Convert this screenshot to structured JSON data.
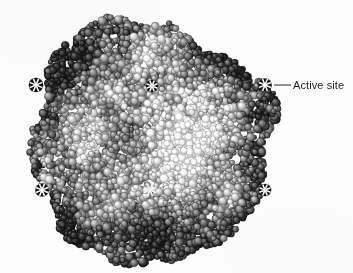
{
  "figure": {
    "kind": "molecular-structure-illustration",
    "width": 353,
    "height": 273,
    "background_color": "#fdfdfd"
  },
  "annotations": {
    "callouts": [
      {
        "id": "active-site-callout",
        "label": "Active site",
        "label_x": 293,
        "label_y": 79,
        "leader": {
          "x1": 274,
          "y1": 85,
          "x2": 291,
          "y2": 85
        },
        "leader_color": "#2a2a2a",
        "text_color": "#1c1c1c"
      }
    ],
    "markers": [
      {
        "id": "active-site-marker-top-left",
        "x": 36,
        "y": 85,
        "r": 7.5,
        "style": "dark",
        "spokes": 8
      },
      {
        "id": "active-site-marker-top-center",
        "x": 152,
        "y": 86,
        "r": 6.5,
        "style": "dark",
        "spokes": 8
      },
      {
        "id": "active-site-marker-top-right",
        "x": 265,
        "y": 85,
        "r": 7.0,
        "style": "dark",
        "spokes": 8
      },
      {
        "id": "active-site-marker-bottom-left",
        "x": 42,
        "y": 190,
        "r": 7.0,
        "style": "dark",
        "spokes": 8
      },
      {
        "id": "active-site-marker-bottom-center",
        "x": 150,
        "y": 190,
        "r": 6.5,
        "style": "light",
        "spokes": 8
      },
      {
        "id": "active-site-marker-bottom-right",
        "x": 265,
        "y": 190,
        "r": 6.5,
        "style": "dark",
        "spokes": 8
      }
    ],
    "marker_colors": {
      "dark": "#141414",
      "light": "#f2f2f2"
    }
  },
  "molecule": {
    "center_x": 150,
    "center_y": 140,
    "radius_x": 124,
    "radius_y": 120,
    "top_edge_y": 22,
    "bottom_edge_y": 258,
    "left_edge_x": 26,
    "right_edge_x": 274,
    "atom_count": 4200,
    "atom_radius_min": 2.4,
    "atom_radius_max": 4.4,
    "palette": {
      "shadow": "#0d0d0d",
      "dark": "#2e2e2e",
      "mid": "#6a6a6a",
      "light": "#b4b4b4",
      "highlight": "#f4f4f4"
    },
    "bright_patches": [
      {
        "cx": 150,
        "cy": 48,
        "rx": 34,
        "ry": 26,
        "intensity": 0.72
      },
      {
        "cx": 196,
        "cy": 128,
        "rx": 40,
        "ry": 38,
        "intensity": 0.8
      },
      {
        "cx": 178,
        "cy": 168,
        "rx": 30,
        "ry": 26,
        "intensity": 0.62
      },
      {
        "cx": 86,
        "cy": 132,
        "rx": 26,
        "ry": 30,
        "intensity": 0.46
      },
      {
        "cx": 120,
        "cy": 96,
        "rx": 20,
        "ry": 18,
        "intensity": 0.4
      },
      {
        "cx": 58,
        "cy": 178,
        "rx": 20,
        "ry": 20,
        "intensity": 0.34
      },
      {
        "cx": 228,
        "cy": 196,
        "rx": 22,
        "ry": 20,
        "intensity": 0.3
      },
      {
        "cx": 104,
        "cy": 212,
        "rx": 24,
        "ry": 18,
        "intensity": 0.26
      }
    ],
    "dark_patches": [
      {
        "cx": 70,
        "cy": 70,
        "rx": 34,
        "ry": 26,
        "intensity": 0.55
      },
      {
        "cx": 240,
        "cy": 70,
        "rx": 32,
        "ry": 26,
        "intensity": 0.5
      },
      {
        "cx": 250,
        "cy": 150,
        "rx": 26,
        "ry": 34,
        "intensity": 0.45
      },
      {
        "cx": 150,
        "cy": 236,
        "rx": 64,
        "ry": 22,
        "intensity": 0.58
      },
      {
        "cx": 52,
        "cy": 226,
        "rx": 28,
        "ry": 20,
        "intensity": 0.5
      },
      {
        "cx": 124,
        "cy": 140,
        "rx": 22,
        "ry": 22,
        "intensity": 0.28
      }
    ]
  }
}
